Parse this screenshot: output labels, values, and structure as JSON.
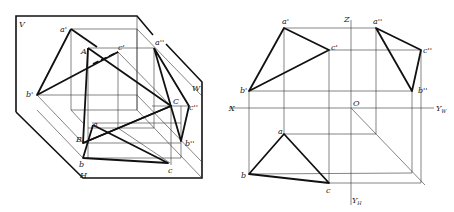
{
  "figure": {
    "left_panel": {
      "description": "Axonometric view of triangle ABC projected onto V, H, W planes",
      "plane_labels": {
        "V": "V",
        "W": "W",
        "H": "H"
      },
      "space_points": {
        "A": "A",
        "B": "B",
        "C": "C"
      },
      "v_projections": {
        "a": "a'",
        "b": "b'",
        "c": "c'"
      },
      "h_projections": {
        "a": "a",
        "b": "b",
        "c": "c"
      },
      "w_projections": {
        "a": "a''",
        "b": "b''",
        "c": "c''"
      }
    },
    "right_panel": {
      "description": "Three-view orthographic projection of triangle ABC",
      "axes": {
        "X": "X",
        "Z": "Z",
        "O": "O",
        "YW": "Y",
        "YW_sub": "W",
        "YH": "Y",
        "YH_sub": "H"
      },
      "front_view": {
        "a": "a'",
        "b": "b'",
        "c": "c'"
      },
      "side_view": {
        "a": "a''",
        "b": "b''",
        "c": "c''"
      },
      "top_view": {
        "a": "a",
        "b": "b",
        "c": "c"
      }
    }
  }
}
